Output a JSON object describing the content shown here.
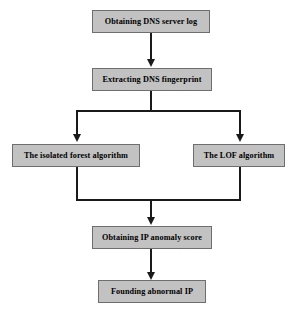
{
  "diagram": {
    "type": "flowchart",
    "orientation": "top-to-bottom",
    "background_color": "#ffffff",
    "node_fill_color": "#c2c2c2",
    "node_border_color": "#6e6e6e",
    "connector_color": "#1a1a1a",
    "nodes": [
      {
        "id": "obtain-log",
        "label": "Obtaining DNS server log"
      },
      {
        "id": "extract-fp",
        "label": "Extracting DNS fingerprint"
      },
      {
        "id": "isolation-forest",
        "label": "The isolated forest algorithm"
      },
      {
        "id": "lof",
        "label": "The LOF algorithm"
      },
      {
        "id": "anomaly-score",
        "label": "Obtaining IP anomaly score"
      },
      {
        "id": "abnormal-ip",
        "label": "Founding abnormal IP"
      }
    ],
    "edges": [
      {
        "from": "obtain-log",
        "to": "extract-fp"
      },
      {
        "from": "extract-fp",
        "to": "isolation-forest"
      },
      {
        "from": "extract-fp",
        "to": "lof"
      },
      {
        "from": "isolation-forest",
        "to": "anomaly-score"
      },
      {
        "from": "lof",
        "to": "anomaly-score"
      },
      {
        "from": "anomaly-score",
        "to": "abnormal-ip"
      }
    ]
  }
}
